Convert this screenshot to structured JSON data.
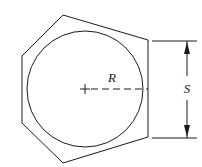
{
  "figure": {
    "background_color": "#ffffff",
    "line_color": "#1a1a1a",
    "width": 202,
    "height": 167
  },
  "labels": {
    "radius": "R",
    "across_flats": "S"
  },
  "geometry": {
    "circle": {
      "center_x": 85,
      "center_y": 89,
      "radius": 58
    },
    "hexagon": {
      "sides": 6,
      "rotation_deg": 7,
      "circumradius": 68,
      "points": "63,15 148,40 148,137 63,163 22,123 22,56"
    },
    "center_mark": {
      "x": 85,
      "y": 89,
      "size": 5
    },
    "radius_line": {
      "x1": 90,
      "y1": 89,
      "x2": 148,
      "y2": 89
    },
    "dimension_s": {
      "line_x": 187,
      "top_y": 41,
      "bottom_y": 138,
      "extension_top_y": 41,
      "extension_bottom_y": 138,
      "extension_x1": 152,
      "extension_x2": 197
    }
  }
}
